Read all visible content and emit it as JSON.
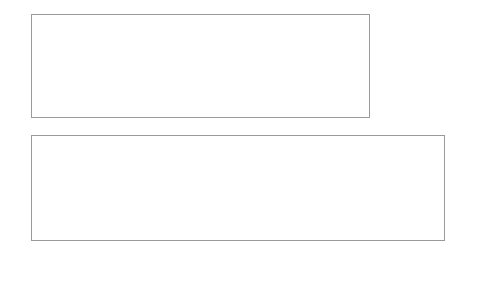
{
  "chart_data": [
    {
      "type": "line",
      "title": "",
      "xlabel": "",
      "ylabel": "",
      "ylim": [
        1,
        1.6
      ],
      "yticks": [
        "1",
        "1.1",
        "1.2",
        "1.3",
        "1.4",
        "1.5",
        "1.6"
      ],
      "grid": false,
      "legend_position": "inside-right",
      "x": [
        "08:00",
        "08:15",
        "08:30",
        "08:45",
        "09:00",
        "09:15",
        "09:30",
        "09:45",
        "10:00",
        "10:15",
        "10:30",
        "10:45",
        "11:00",
        "11:15",
        "11:30",
        "11:45",
        "12:00",
        "12:15",
        "12:30",
        "12:45",
        "13:00",
        "13:15",
        "13:30",
        "13:45",
        "14:00",
        "14:15",
        "14:30",
        "14:45",
        "15:00",
        "15:15",
        "15:30",
        "15:45",
        "16:00",
        "16:15",
        "16:30"
      ],
      "series": [
        {
          "name": "XYZ price",
          "color": "#1f1f1f",
          "marker": "diamond",
          "values": [
            1.497,
            1.492,
            1.487,
            1.49,
            1.496,
            1.496,
            1.504,
            1.499,
            1.5,
            1.498,
            1.499,
            1.495,
            1.49,
            1.494,
            1.494,
            1.494,
            1.492,
            1.48,
            1.467,
            1.461,
            1.446,
            1.443,
            1.444,
            1.424,
            1.429,
            1.422,
            1.422,
            1.441,
            1.449,
            1.466,
            1.456,
            1.447,
            1.438,
            1.444,
            1.448
          ]
        },
        {
          "name": "EFG price",
          "color": "#a8a8a8",
          "marker": "square",
          "values": [
            1.21,
            1.193,
            1.18,
            1.176,
            1.157,
            1.163,
            1.167,
            1.173,
            1.184,
            1.188,
            1.185,
            1.196,
            1.204,
            1.211,
            1.21,
            1.192,
            1.208,
            1.213,
            1.215,
            1.212,
            1.213,
            1.218,
            1.218,
            1.22,
            1.223,
            1.22,
            1.223,
            1.221,
            1.218,
            1.217,
            1.218,
            1.211,
            1.216,
            1.215,
            1.214
          ]
        }
      ]
    },
    {
      "type": "line",
      "title": "",
      "xlabel": "",
      "ylabel": "",
      "ylim": [
        0.1,
        0.4
      ],
      "yticks": [
        "0.1",
        "0.2",
        "0.3",
        "0.4"
      ],
      "ylim_right": [
        1.1,
        1.3
      ],
      "yticks_right": [
        "1.1",
        "1.2",
        "1.3"
      ],
      "grid": false,
      "legend_position": "inside-right",
      "x": [
        "08:00",
        "08:15",
        "08:30",
        "08:45",
        "09:00",
        "09:15",
        "09:30",
        "09:45",
        "10:00",
        "10:15",
        "10:30",
        "10:45",
        "11:00",
        "11:15",
        "11:30",
        "11:45",
        "12:00",
        "12:15",
        "12:30",
        "12:45",
        "13:00",
        "13:15",
        "13:30",
        "13:45",
        "14:00",
        "14:15",
        "14:30",
        "14:45",
        "15:00",
        "15:15",
        "15:30",
        "15:45",
        "16:00",
        "16:15",
        "16:30"
      ],
      "series": [
        {
          "name": "Ratio",
          "color": "#9d9d9d",
          "marker": "square",
          "axis": "left",
          "values": [
            0.29,
            0.303,
            0.308,
            0.316,
            0.327,
            0.337,
            0.336,
            0.331,
            0.323,
            0.312,
            0.313,
            0.305,
            0.28,
            0.275,
            0.277,
            0.277,
            0.3,
            0.281,
            0.257,
            0.249,
            0.237,
            0.231,
            0.221,
            0.198,
            0.221,
            0.192,
            0.192,
            0.192,
            0.186,
            0.2,
            0.218,
            0.232,
            0.232,
            0.227,
            0.2,
            0.215,
            0.222
          ]
        },
        {
          "name": "Spread",
          "color": "#1f1f1f",
          "marker": "diamond",
          "axis": "right",
          "values": [
            1.24,
            1.256,
            1.262,
            1.272,
            1.282,
            1.293,
            1.29,
            1.286,
            1.274,
            1.268,
            1.269,
            1.258,
            1.236,
            1.232,
            1.232,
            1.236,
            1.251,
            1.243,
            1.23,
            1.224,
            1.217,
            1.212,
            1.204,
            1.19,
            1.205,
            1.183,
            1.182,
            1.183,
            1.175,
            1.19,
            1.205,
            1.209,
            1.209,
            1.205,
            1.19,
            1.196,
            1.199
          ]
        }
      ]
    }
  ],
  "top_chart": {
    "yticks": [
      "1.6",
      "1.5",
      "1.4",
      "1.3",
      "1.2",
      "1.1",
      "1"
    ],
    "legend": [
      {
        "label": "XYZ price",
        "color": "#1f1f1f",
        "marker": "diamond"
      },
      {
        "label": "EFG price",
        "color": "#a8a8a8",
        "marker": "square"
      }
    ]
  },
  "bottom_chart": {
    "yticks_left": [
      "0.4",
      "0.3",
      "0.2",
      "0.1"
    ],
    "yticks_right": [
      "1.3",
      "1.2",
      "1.1"
    ],
    "legend": [
      {
        "label": "Ratio",
        "color": "#9d9d9d",
        "marker": "square"
      },
      {
        "label": "Spread",
        "color": "#1f1f1f",
        "marker": "diamond"
      }
    ],
    "xticks": [
      "08:00",
      "08:30",
      "09:00",
      "09:30",
      "10:00",
      "10:30",
      "11:00",
      "11:30",
      "12:00",
      "12:30",
      "13:00",
      "13:30",
      "14:00",
      "14:30",
      "15:00",
      "15:30",
      "16:00",
      "16:30"
    ]
  },
  "colors": {
    "dark_series": "#1f1f1f",
    "light_series": "#a8a8a8",
    "frame": "#9a9a9a",
    "background": "#ffffff"
  }
}
